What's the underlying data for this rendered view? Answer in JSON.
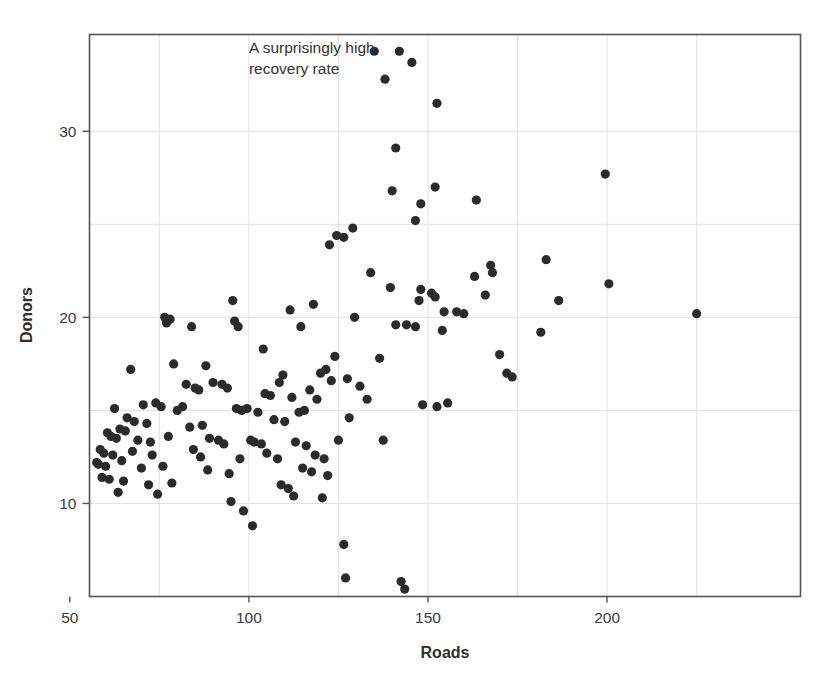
{
  "chart_data": {
    "type": "scatter",
    "title": "",
    "xlabel": "Roads",
    "ylabel": "Donors",
    "xlim": [
      55.5,
      254
    ],
    "ylim": [
      5.0,
      35.2
    ],
    "grid": true,
    "grid_color": "#e2e2e2",
    "point_color": "#2b2b2b",
    "point_radius": 4.6,
    "xticks": [
      50,
      100,
      150,
      200
    ],
    "xtick_labels": [
      "50",
      "100",
      "150",
      "200"
    ],
    "yticks": [
      10,
      20,
      30
    ],
    "ytick_labels": [
      "10",
      "20",
      "30"
    ],
    "x_minor_gridlines": [
      75,
      125,
      175,
      225
    ],
    "y_minor_gridlines": [
      15,
      25
    ],
    "annotations": [
      {
        "text": "A surprisingly high\nrecovery rate",
        "x": 100.0,
        "y": 34.2,
        "align": "left"
      }
    ],
    "series": [
      {
        "name": "countries",
        "points": [
          [
            135.0,
            34.3
          ],
          [
            142.0,
            34.3
          ],
          [
            145.5,
            33.7
          ],
          [
            138.0,
            32.8
          ],
          [
            152.5,
            31.5
          ],
          [
            199.5,
            27.7
          ],
          [
            141.0,
            29.1
          ],
          [
            163.5,
            26.3
          ],
          [
            140.0,
            26.8
          ],
          [
            148.0,
            26.1
          ],
          [
            152.0,
            27.0
          ],
          [
            146.5,
            25.2
          ],
          [
            129.0,
            24.8
          ],
          [
            124.5,
            24.4
          ],
          [
            126.5,
            24.3
          ],
          [
            122.5,
            23.9
          ],
          [
            183.0,
            23.1
          ],
          [
            167.5,
            22.8
          ],
          [
            168.0,
            22.4
          ],
          [
            134.0,
            22.4
          ],
          [
            163.0,
            22.2
          ],
          [
            139.5,
            21.6
          ],
          [
            148.0,
            21.5
          ],
          [
            151.0,
            21.3
          ],
          [
            152.0,
            21.1
          ],
          [
            166.0,
            21.2
          ],
          [
            200.5,
            21.8
          ],
          [
            186.5,
            20.9
          ],
          [
            225.0,
            20.2
          ],
          [
            147.5,
            20.9
          ],
          [
            118.0,
            20.7
          ],
          [
            111.5,
            20.4
          ],
          [
            129.5,
            20.0
          ],
          [
            154.5,
            20.3
          ],
          [
            158.0,
            20.3
          ],
          [
            160.0,
            20.2
          ],
          [
            76.5,
            20.0
          ],
          [
            78.0,
            19.9
          ],
          [
            77.0,
            19.7
          ],
          [
            95.5,
            20.9
          ],
          [
            84.0,
            19.5
          ],
          [
            96.0,
            19.8
          ],
          [
            97.0,
            19.5
          ],
          [
            114.5,
            19.5
          ],
          [
            141.0,
            19.6
          ],
          [
            144.0,
            19.6
          ],
          [
            146.5,
            19.5
          ],
          [
            154.0,
            19.3
          ],
          [
            181.5,
            19.2
          ],
          [
            170.0,
            18.0
          ],
          [
            104.0,
            18.3
          ],
          [
            124.0,
            17.9
          ],
          [
            136.5,
            17.8
          ],
          [
            121.5,
            17.2
          ],
          [
            120.0,
            17.0
          ],
          [
            109.5,
            16.9
          ],
          [
            172.0,
            17.0
          ],
          [
            173.5,
            16.8
          ],
          [
            79.0,
            17.5
          ],
          [
            67.0,
            17.2
          ],
          [
            88.0,
            17.4
          ],
          [
            108.5,
            16.5
          ],
          [
            123.0,
            16.6
          ],
          [
            127.5,
            16.7
          ],
          [
            131.0,
            16.3
          ],
          [
            117.0,
            16.1
          ],
          [
            90.0,
            16.5
          ],
          [
            92.5,
            16.4
          ],
          [
            94.0,
            16.2
          ],
          [
            85.0,
            16.2
          ],
          [
            86.0,
            16.1
          ],
          [
            82.5,
            16.4
          ],
          [
            104.5,
            15.9
          ],
          [
            106.0,
            15.8
          ],
          [
            112.0,
            15.7
          ],
          [
            119.0,
            15.6
          ],
          [
            133.0,
            15.6
          ],
          [
            148.5,
            15.3
          ],
          [
            152.5,
            15.2
          ],
          [
            155.5,
            15.4
          ],
          [
            62.5,
            15.1
          ],
          [
            70.5,
            15.3
          ],
          [
            74.0,
            15.4
          ],
          [
            75.5,
            15.2
          ],
          [
            80.0,
            15.0
          ],
          [
            81.5,
            15.2
          ],
          [
            96.5,
            15.1
          ],
          [
            98.0,
            15.0
          ],
          [
            99.5,
            15.1
          ],
          [
            114.0,
            14.9
          ],
          [
            115.5,
            15.0
          ],
          [
            128.0,
            14.6
          ],
          [
            102.5,
            14.9
          ],
          [
            107.0,
            14.5
          ],
          [
            110.0,
            14.4
          ],
          [
            66.0,
            14.6
          ],
          [
            68.0,
            14.4
          ],
          [
            71.5,
            14.3
          ],
          [
            83.5,
            14.1
          ],
          [
            87.0,
            14.2
          ],
          [
            64.0,
            14.0
          ],
          [
            65.5,
            13.9
          ],
          [
            60.5,
            13.8
          ],
          [
            61.5,
            13.6
          ],
          [
            63.0,
            13.5
          ],
          [
            69.0,
            13.4
          ],
          [
            72.5,
            13.3
          ],
          [
            77.5,
            13.6
          ],
          [
            89.0,
            13.5
          ],
          [
            91.5,
            13.4
          ],
          [
            93.0,
            13.2
          ],
          [
            100.5,
            13.4
          ],
          [
            101.5,
            13.3
          ],
          [
            103.5,
            13.2
          ],
          [
            113.0,
            13.3
          ],
          [
            116.0,
            13.1
          ],
          [
            125.0,
            13.4
          ],
          [
            137.5,
            13.4
          ],
          [
            58.5,
            12.9
          ],
          [
            59.5,
            12.7
          ],
          [
            62.0,
            12.6
          ],
          [
            67.5,
            12.8
          ],
          [
            73.0,
            12.6
          ],
          [
            84.5,
            12.9
          ],
          [
            86.5,
            12.5
          ],
          [
            97.5,
            12.4
          ],
          [
            105.0,
            12.7
          ],
          [
            108.0,
            12.4
          ],
          [
            118.5,
            12.6
          ],
          [
            121.0,
            12.4
          ],
          [
            57.5,
            12.2
          ],
          [
            58.0,
            12.1
          ],
          [
            60.0,
            12.0
          ],
          [
            64.5,
            12.3
          ],
          [
            70.0,
            11.9
          ],
          [
            76.0,
            12.0
          ],
          [
            88.5,
            11.8
          ],
          [
            94.5,
            11.6
          ],
          [
            115.0,
            11.9
          ],
          [
            117.5,
            11.7
          ],
          [
            122.0,
            11.5
          ],
          [
            59.0,
            11.4
          ],
          [
            61.0,
            11.3
          ],
          [
            65.0,
            11.2
          ],
          [
            72.0,
            11.0
          ],
          [
            78.5,
            11.1
          ],
          [
            109.0,
            11.0
          ],
          [
            111.0,
            10.8
          ],
          [
            63.5,
            10.6
          ],
          [
            74.5,
            10.5
          ],
          [
            112.5,
            10.4
          ],
          [
            120.5,
            10.3
          ],
          [
            95.0,
            10.1
          ],
          [
            98.5,
            9.6
          ],
          [
            101.0,
            8.8
          ],
          [
            126.5,
            7.8
          ],
          [
            127.0,
            6.0
          ],
          [
            142.5,
            5.8
          ],
          [
            143.5,
            5.4
          ]
        ]
      }
    ]
  }
}
